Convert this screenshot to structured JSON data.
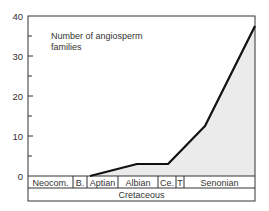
{
  "chart_data": {
    "type": "area",
    "title_lines": [
      "Number of angiosperm",
      "families"
    ],
    "xlabel": "Cretaceous",
    "ylabel": "",
    "ylim": [
      0,
      40
    ],
    "yticks_labeled": [
      0,
      10,
      20,
      30,
      40
    ],
    "yticks_minor": [
      5,
      15,
      25,
      35
    ],
    "grid": false,
    "legend": null,
    "stages": [
      {
        "label": "Neocom.",
        "x0": 28,
        "x1": 73
      },
      {
        "label": "B.",
        "x0": 73,
        "x1": 87
      },
      {
        "label": "Aptian",
        "x0": 87,
        "x1": 118
      },
      {
        "label": "Albian",
        "x0": 118,
        "x1": 158
      },
      {
        "label": "Ce.",
        "x0": 158,
        "x1": 176
      },
      {
        "label": "T",
        "x0": 176,
        "x1": 184
      },
      {
        "label": "Senonian",
        "x0": 184,
        "x1": 255
      }
    ],
    "series": [
      {
        "name": "Number of angiosperm families",
        "points": [
          {
            "stage_position": "mid-Aptian",
            "px": 90,
            "value": 0
          },
          {
            "stage_position": "mid-Albian",
            "px": 137,
            "value": 3
          },
          {
            "stage_position": "Cenomanian",
            "px": 168,
            "value": 3
          },
          {
            "stage_position": "mid-Senonian",
            "px": 205,
            "value": 12.5
          },
          {
            "stage_position": "end-Senonian",
            "px": 255,
            "value": 37.5
          }
        ]
      }
    ],
    "fill_color": "#ebebeb",
    "line_color": "#111111"
  }
}
